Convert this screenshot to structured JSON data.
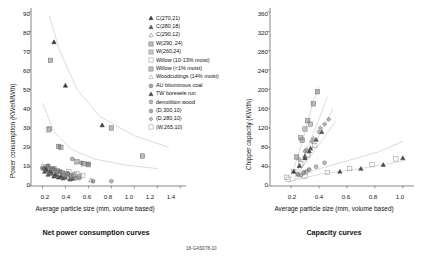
{
  "figure": {
    "footnote": "18-GAS078-10"
  },
  "panels": [
    {
      "id": "net-power",
      "caption": "Net power consumption curves",
      "xlabel": "Average particle size (mm, volume based)",
      "ylabel": "Power consumption (KWe/MWth)",
      "xticks": [
        "0.2",
        "0.4",
        "0.6",
        "0.8",
        "1.0",
        "1.2",
        "1.4"
      ],
      "yticks": [
        "0",
        "10",
        "20",
        "30",
        "40",
        "50",
        "60",
        "70",
        "80",
        "90"
      ]
    },
    {
      "id": "capacity",
      "caption": "Capacity curves",
      "xlabel": "Average particle size (mm, volume based)",
      "ylabel": "Chipper capacity (KW/th)",
      "xticks": [
        "0.2",
        "0.4",
        "0.6",
        "0.8",
        "1.0"
      ],
      "yticks": [
        "0",
        "40",
        "80",
        "120",
        "160",
        "200",
        "240",
        "280",
        "320",
        "360"
      ]
    }
  ],
  "legend": {
    "items": [
      {
        "label": "C(270,21)",
        "marker": "triangle-filled",
        "color": "#3a3a3a"
      },
      {
        "label": "C(280,18)",
        "marker": "triangle-filled",
        "color": "#555555"
      },
      {
        "label": "C(290,12)",
        "marker": "triangle-open",
        "color": "#777777"
      },
      {
        "label": "W(290, 24)",
        "marker": "square-grid",
        "color": "#6a6a6a"
      },
      {
        "label": "W(260,24)",
        "marker": "square-grid",
        "color": "#808080"
      },
      {
        "label": "Willow (10-13% moist)",
        "marker": "square-open",
        "color": "#8a8a8a"
      },
      {
        "label": "Willow (<1% moist)",
        "marker": "square-grid",
        "color": "#707070"
      },
      {
        "label": "Woodcuttings (14% moist)",
        "marker": "triangle-open",
        "color": "#909090"
      },
      {
        "label": "AU bituminous coal",
        "marker": "circle-dot",
        "color": "#5f5f5f"
      },
      {
        "label": "TW boresele run",
        "marker": "triangle-filled",
        "color": "#4a4a4a"
      },
      {
        "label": "demolition wood",
        "marker": "circle-dot",
        "color": "#808080"
      },
      {
        "label": "(D,300,10)",
        "marker": "circle-dot",
        "color": "#6e6e6e"
      },
      {
        "label": "(D,280,10)",
        "marker": "diamond-dot",
        "color": "#7a7a7a"
      },
      {
        "label": "(W,265,10)",
        "marker": "square-open",
        "color": "#8e8e8e"
      }
    ]
  },
  "chart_data": [
    {
      "type": "scatter",
      "title": "Net power consumption curves",
      "xlabel": "Average particle size (mm, volume based)",
      "ylabel": "Power consumption (KWe/MWth)",
      "xlim": [
        0.1,
        1.45
      ],
      "ylim": [
        0,
        90
      ],
      "grid": false,
      "legend_position": "right",
      "series": [
        {
          "name": "C(270,21)",
          "marker": "triangle-filled",
          "points": [
            [
              0.3,
              74.5
            ],
            [
              0.4,
              52.0
            ],
            [
              0.72,
              31.5
            ],
            [
              0.22,
              7.5
            ],
            [
              0.25,
              6.0
            ],
            [
              0.3,
              5.0
            ],
            [
              0.34,
              4.5
            ],
            [
              0.38,
              4.0
            ],
            [
              0.44,
              3.5
            ],
            [
              0.27,
              8.5
            ]
          ]
        },
        {
          "name": "C(280,18)",
          "marker": "triangle-filled",
          "points": [
            [
              0.21,
              9.5
            ],
            [
              0.24,
              8.0
            ],
            [
              0.28,
              6.5
            ],
            [
              0.33,
              5.5
            ],
            [
              0.4,
              4.5
            ],
            [
              0.46,
              3.8
            ]
          ]
        },
        {
          "name": "C(290,12)",
          "marker": "triangle-open",
          "points": [
            [
              0.2,
              10.5
            ],
            [
              0.23,
              9.0
            ],
            [
              0.26,
              7.0
            ],
            [
              0.31,
              6.0
            ],
            [
              0.36,
              5.0
            ],
            [
              0.62,
              3.0
            ]
          ]
        },
        {
          "name": "W(290, 24)",
          "marker": "square-grid",
          "points": [
            [
              0.27,
              65.0
            ],
            [
              0.26,
              29.5
            ],
            [
              0.8,
              30.0
            ],
            [
              0.34,
              20.5
            ],
            [
              0.36,
              20.0
            ],
            [
              0.5,
              12.5
            ],
            [
              0.56,
              11.5
            ],
            [
              0.6,
              11.0
            ],
            [
              1.07,
              15.5
            ]
          ]
        },
        {
          "name": "W(260,24)",
          "marker": "square-grid",
          "points": [
            [
              0.3,
              9.0
            ],
            [
              0.33,
              8.0
            ],
            [
              0.37,
              7.0
            ],
            [
              0.42,
              6.0
            ],
            [
              0.47,
              5.5
            ],
            [
              0.52,
              5.0
            ]
          ]
        },
        {
          "name": "Willow (10-13% moist)",
          "marker": "square-open",
          "points": [
            [
              0.29,
              8.5
            ],
            [
              0.35,
              7.5
            ],
            [
              0.41,
              6.5
            ],
            [
              0.48,
              6.0
            ],
            [
              0.55,
              5.5
            ]
          ]
        },
        {
          "name": "Willow (<1% moist)",
          "marker": "square-grid",
          "points": [
            [
              0.24,
              10.0
            ],
            [
              0.3,
              8.0
            ],
            [
              0.38,
              6.0
            ],
            [
              0.45,
              5.0
            ]
          ]
        },
        {
          "name": "Woodcuttings (14% moist)",
          "marker": "triangle-open",
          "points": [
            [
              0.22,
              8.0
            ],
            [
              0.26,
              6.5
            ],
            [
              0.32,
              5.5
            ],
            [
              0.39,
              4.5
            ],
            [
              0.43,
              4.0
            ]
          ]
        },
        {
          "name": "AU bituminous coal",
          "marker": "circle-dot",
          "points": [
            [
              0.25,
              10.5
            ],
            [
              0.29,
              9.0
            ],
            [
              0.35,
              7.5
            ],
            [
              0.42,
              6.5
            ],
            [
              0.49,
              4.0
            ],
            [
              0.64,
              2.5
            ]
          ]
        },
        {
          "name": "TW boresele run",
          "marker": "triangle-filled",
          "points": [
            [
              0.23,
              9.0
            ],
            [
              0.27,
              7.5
            ],
            [
              0.31,
              6.0
            ],
            [
              0.36,
              5.0
            ]
          ]
        },
        {
          "name": "demolition wood",
          "marker": "circle-dot",
          "points": [
            [
              0.26,
              9.5
            ],
            [
              0.31,
              8.0
            ],
            [
              0.37,
              6.5
            ],
            [
              0.44,
              5.0
            ],
            [
              0.52,
              4.0
            ],
            [
              0.8,
              2.5
            ]
          ]
        },
        {
          "name": "(D,300,10)",
          "marker": "circle-dot",
          "points": [
            [
              0.46,
              14.0
            ],
            [
              0.54,
              12.0
            ],
            [
              0.6,
              11.5
            ],
            [
              0.2,
              9.0
            ]
          ]
        },
        {
          "name": "(D,280,10)",
          "marker": "diamond-dot",
          "points": [
            [
              0.28,
              8.5
            ],
            [
              0.33,
              7.0
            ],
            [
              0.4,
              5.5
            ]
          ]
        },
        {
          "name": "(W,265,10)",
          "marker": "square-open",
          "points": [
            [
              0.43,
              7.5
            ],
            [
              0.5,
              6.5
            ],
            [
              0.25,
              29.0
            ]
          ]
        }
      ],
      "fit_curves": [
        {
          "name": "upper-decay",
          "points": [
            [
              0.26,
              88
            ],
            [
              0.35,
              70
            ],
            [
              0.5,
              50
            ],
            [
              0.7,
              36
            ],
            [
              1.0,
              26
            ],
            [
              1.3,
              20
            ]
          ]
        },
        {
          "name": "lower-decay",
          "points": [
            [
              0.2,
              43
            ],
            [
              0.3,
              28
            ],
            [
              0.45,
              19
            ],
            [
              0.65,
              14
            ],
            [
              0.9,
              11
            ],
            [
              1.2,
              9
            ]
          ]
        }
      ]
    },
    {
      "type": "scatter",
      "title": "Capacity curves",
      "xlabel": "Average particle size (mm, volume based)",
      "ylabel": "Chipper capacity (KW/th)",
      "xlim": [
        0.05,
        1.08
      ],
      "ylim": [
        0,
        360
      ],
      "grid": false,
      "legend_position": "none",
      "series": [
        {
          "name": "C(270,21)",
          "marker": "triangle-filled",
          "points": [
            [
              0.22,
              30
            ],
            [
              0.26,
              42
            ],
            [
              0.3,
              58
            ],
            [
              0.33,
              72
            ]
          ]
        },
        {
          "name": "C(280,18)",
          "marker": "triangle-filled",
          "points": [
            [
              0.3,
              62
            ],
            [
              0.34,
              78
            ],
            [
              0.38,
              96
            ],
            [
              0.42,
              112
            ]
          ]
        },
        {
          "name": "W(290, 24)",
          "marker": "square-grid",
          "points": [
            [
              0.24,
              60
            ],
            [
              0.28,
              95
            ],
            [
              0.32,
              135
            ],
            [
              0.36,
              170
            ],
            [
              0.39,
              195
            ]
          ]
        },
        {
          "name": "W(260,24)",
          "marker": "square-grid",
          "points": [
            [
              0.3,
              118
            ],
            [
              0.34,
              128
            ],
            [
              0.27,
              100
            ]
          ]
        },
        {
          "name": "Willow (10-13% moist)",
          "marker": "square-open",
          "points": [
            [
              0.17,
              18
            ],
            [
              0.22,
              30
            ],
            [
              0.27,
              46
            ],
            [
              0.32,
              64
            ],
            [
              0.37,
              84
            ]
          ]
        },
        {
          "name": "(D,300,10)",
          "marker": "diamond-dot",
          "points": [
            [
              0.3,
              72
            ],
            [
              0.35,
              92
            ],
            [
              0.4,
              112
            ],
            [
              0.44,
              128
            ],
            [
              0.47,
              138
            ]
          ]
        },
        {
          "name": "(D,280,10)",
          "marker": "diamond-dot",
          "points": [
            [
              0.26,
              55
            ],
            [
              0.31,
              75
            ],
            [
              0.36,
              98
            ],
            [
              0.41,
              120
            ]
          ]
        },
        {
          "name": "demolition wood",
          "marker": "circle-dot",
          "points": [
            [
              0.27,
              22
            ],
            [
              0.31,
              30
            ],
            [
              0.38,
              40
            ],
            [
              0.44,
              48
            ]
          ]
        },
        {
          "name": "(W,265,10)",
          "marker": "square-open",
          "points": [
            [
              0.18,
              14
            ],
            [
              0.3,
              20
            ],
            [
              0.46,
              28
            ],
            [
              0.62,
              36
            ],
            [
              0.78,
              44
            ],
            [
              0.95,
              56
            ]
          ]
        },
        {
          "name": "AU bituminous coal",
          "marker": "circle-dot",
          "points": [
            [
              0.25,
              24
            ],
            [
              0.29,
              28
            ],
            [
              0.33,
              34
            ]
          ]
        },
        {
          "name": "TW boresele run",
          "marker": "triangle-filled",
          "points": [
            [
              0.55,
              30
            ],
            [
              0.7,
              36
            ],
            [
              0.86,
              44
            ],
            [
              1.0,
              58
            ]
          ]
        }
      ],
      "fit_curves": [
        {
          "name": "steep-1",
          "points": [
            [
              0.2,
              18
            ],
            [
              0.28,
              90
            ],
            [
              0.36,
              175
            ],
            [
              0.4,
              205
            ]
          ]
        },
        {
          "name": "steep-2",
          "points": [
            [
              0.23,
              20
            ],
            [
              0.32,
              80
            ],
            [
              0.41,
              145
            ],
            [
              0.46,
              185
            ]
          ]
        },
        {
          "name": "mid-1",
          "points": [
            [
              0.24,
              18
            ],
            [
              0.34,
              70
            ],
            [
              0.44,
              125
            ],
            [
              0.5,
              160
            ]
          ]
        },
        {
          "name": "mid-2",
          "points": [
            [
              0.22,
              14
            ],
            [
              0.33,
              58
            ],
            [
              0.45,
              105
            ],
            [
              0.52,
              135
            ]
          ]
        },
        {
          "name": "low-1",
          "points": [
            [
              0.2,
              10
            ],
            [
              0.38,
              34
            ],
            [
              0.6,
              52
            ],
            [
              0.82,
              70
            ],
            [
              1.0,
              92
            ]
          ]
        },
        {
          "name": "low-2",
          "points": [
            [
              0.18,
              8
            ],
            [
              0.4,
              24
            ],
            [
              0.65,
              34
            ],
            [
              0.9,
              46
            ],
            [
              1.02,
              54
            ]
          ]
        }
      ]
    }
  ]
}
